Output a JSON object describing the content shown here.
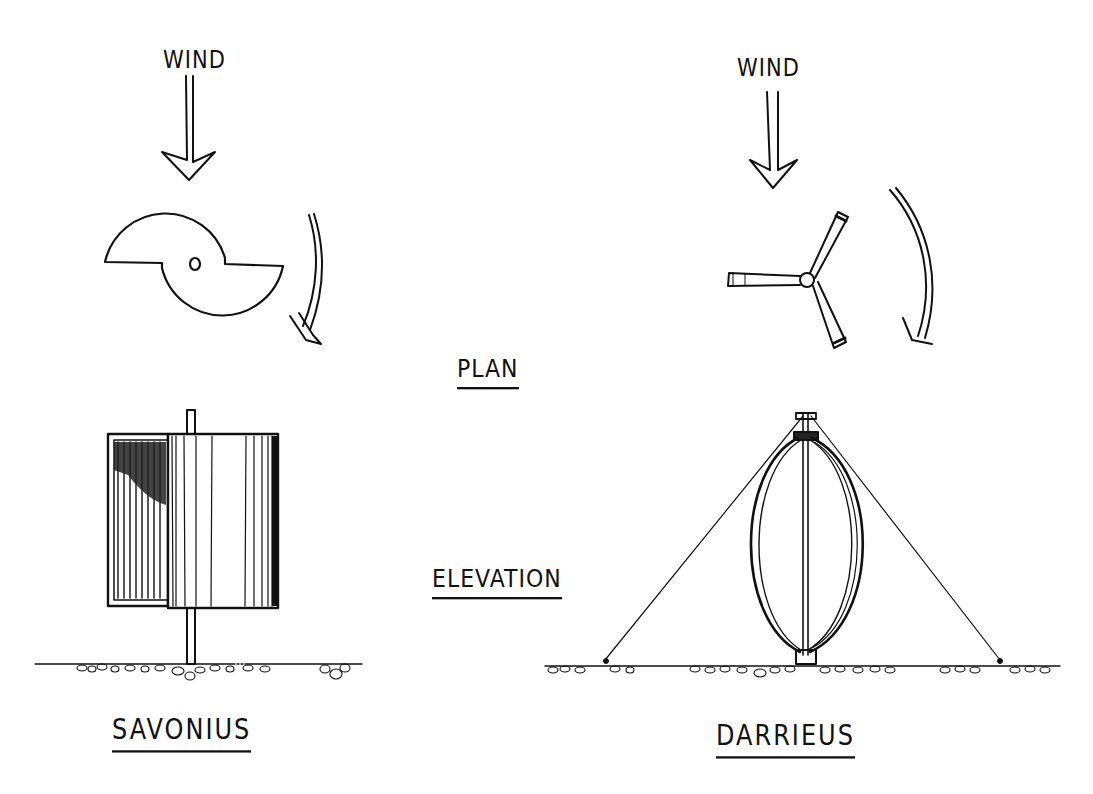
{
  "labels": {
    "wind_left": "WIND",
    "wind_right": "WIND",
    "plan": "PLAN",
    "elevation": "ELEVATION",
    "savonius": "SAVONIUS",
    "darrieus": "DARRIEUS"
  },
  "diagram": {
    "columns": [
      {
        "name": "SAVONIUS",
        "plan_view": "split-S rotor (two half-cylinders offset about a central shaft)",
        "elevation_view": "drum rotor on vertical shaft"
      },
      {
        "name": "DARRIEUS",
        "plan_view": "three-blade hub (eggbeater, plan)",
        "elevation_view": "eggbeater/curved blades on vertical mast with guy wires"
      }
    ],
    "rows": [
      "PLAN",
      "ELEVATION"
    ],
    "arrows": [
      "wind direction (downward)",
      "rotation direction (clockwise)"
    ],
    "colors": {
      "ink": "#111111",
      "paper": "#ffffff"
    }
  }
}
